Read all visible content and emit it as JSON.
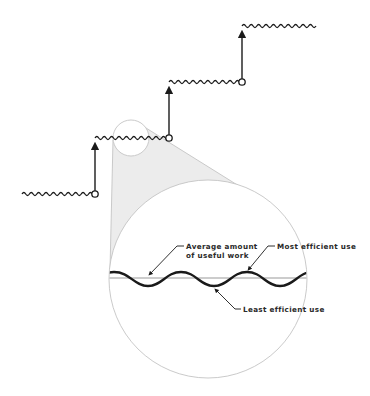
{
  "title": {
    "text": "",
    "note": "Partially cropped heading at top edge; illegible"
  },
  "staircase": {
    "levels": [
      {
        "name": "level-1",
        "y": 194,
        "x_start": 22,
        "x_end": 95
      },
      {
        "name": "level-2",
        "y": 138,
        "x_start": 95,
        "x_end": 169
      },
      {
        "name": "level-3",
        "y": 82,
        "x_start": 169,
        "x_end": 242
      },
      {
        "name": "level-4",
        "y": 26,
        "x_start": 242,
        "x_end": 316
      }
    ],
    "arrows": [
      {
        "x": 95,
        "y_from": 194,
        "y_to": 142
      },
      {
        "x": 169,
        "y_from": 138,
        "y_to": 86
      },
      {
        "x": 242,
        "y_from": 82,
        "y_to": 30
      }
    ]
  },
  "magnifier": {
    "small_circle": {
      "cx": 131,
      "cy": 138,
      "r": 18
    },
    "large_circle": {
      "cx": 208,
      "cy": 279,
      "r": 99
    },
    "cone_fill": "#ececec",
    "outline_color": "#c4c4c4"
  },
  "detail": {
    "baseline_y": 278,
    "labels": {
      "average_line1": "Average amount",
      "average_line2": "of useful work",
      "most_efficient": "Most efficient use",
      "least_efficient": "Least efficient use"
    }
  },
  "colors": {
    "ink": "#1a1a1a",
    "line_gray": "#9a9a9a",
    "circle_gray": "#c4c4c4",
    "cone_gray": "#ececec"
  }
}
